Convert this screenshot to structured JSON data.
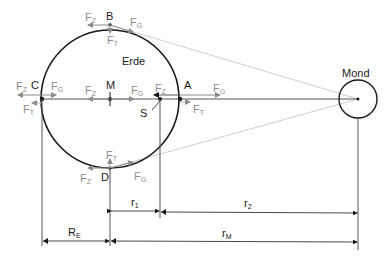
{
  "diagram": {
    "title_earth": "Erde",
    "title_moon": "Mond",
    "points": {
      "A": "A",
      "B": "B",
      "C": "C",
      "D": "D",
      "M": "M",
      "S": "S"
    },
    "forces": {
      "fz": {
        "main": "F",
        "sub": "Z"
      },
      "fg": {
        "main": "F",
        "sub": "G"
      },
      "ft": {
        "main": "F",
        "sub": "T"
      }
    },
    "dimensions": {
      "r1": {
        "main": "r",
        "sub": "1"
      },
      "r2": {
        "main": "r",
        "sub": "2"
      },
      "re": {
        "main": "R",
        "sub": "E"
      },
      "rm": {
        "main": "r",
        "sub": "M"
      }
    },
    "colors": {
      "outline": "#1a1a1a",
      "force_arrows": "#8c8c8c",
      "tangent_lines": "#d0d0d0",
      "axis": "#555555"
    }
  }
}
